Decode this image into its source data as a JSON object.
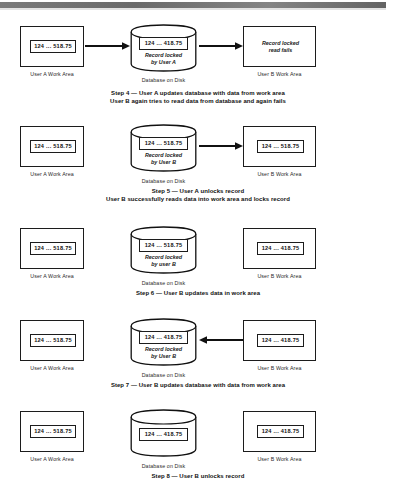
{
  "page": {
    "labels": {
      "user_a_work_area": "User A Work Area",
      "user_b_work_area": "User B Work Area",
      "database_on_disk": "Database on Disk"
    }
  },
  "steps": [
    {
      "id": "step-4",
      "left_box": {
        "value": "124 ... 518.75",
        "label": "User A Work Area"
      },
      "database": {
        "value": "124 ... 418.75",
        "note_line1": "Record locked",
        "note_line2": "by User A",
        "label": "Database on Disk"
      },
      "right_box": {
        "note_line1": "Record locked",
        "note_line2": "read fails",
        "label": "User B Work Area"
      },
      "arrow_left": {
        "direction": "right",
        "name": "arrow-work-area-a-to-database"
      },
      "arrow_right": {
        "direction": "right",
        "name": "arrow-database-to-work-area-b"
      },
      "caption_line1": "Step 4 — User A updates database with data from work area",
      "caption_line2": "User B again tries to read data from database and again fails"
    },
    {
      "id": "step-5",
      "left_box": {
        "value": "124 ... 518.75",
        "label": "User A Work Area"
      },
      "database": {
        "value": "124 ... 518.75",
        "note_line1": "Record locked",
        "note_line2": "by User B",
        "label": "Database on Disk"
      },
      "right_box": {
        "value": "124 ... 518.75",
        "label": "User B Work Area"
      },
      "arrow_right": {
        "direction": "right",
        "name": "arrow-database-to-work-area-b"
      },
      "caption_line1": "Step 5 — User A unlocks record",
      "caption_line2": "User B successfully reads data into work area and locks record"
    },
    {
      "id": "step-6",
      "left_box": {
        "value": "124 ... 518.75",
        "label": "User A Work Area"
      },
      "database": {
        "value": "124 ... 518.75",
        "note_line1": "Record locked",
        "note_line2": "by user B",
        "label": "Database on Disk"
      },
      "right_box": {
        "value": "124 ... 418.75",
        "label": "User B Work Area"
      },
      "caption_line1": "Step 6 — User B updates data in work area",
      "caption_line2": ""
    },
    {
      "id": "step-7",
      "left_box": {
        "value": "124 ... 518.75",
        "label": "User A Work Area"
      },
      "database": {
        "value": "124 ... 418.75",
        "note_line1": "Record locked",
        "note_line2": "by  User B",
        "label": "Database on Disk"
      },
      "right_box": {
        "value": "124 ... 418.75",
        "label": "User B Work Area"
      },
      "arrow_right": {
        "direction": "left",
        "name": "arrow-work-area-b-to-database"
      },
      "caption_line1": "Step 7 — User B updates database with data from work area",
      "caption_line2": ""
    },
    {
      "id": "step-8",
      "left_box": {
        "value": "124 ... 518.75",
        "label": "User A Work Area"
      },
      "database": {
        "value": "124 ... 418.75",
        "label": "Database on Disk"
      },
      "right_box": {
        "value": "124 ... 418.75",
        "label": "User B Work Area"
      },
      "caption_line1": "Step 8 — User B unlocks record",
      "caption_line2": ""
    }
  ]
}
